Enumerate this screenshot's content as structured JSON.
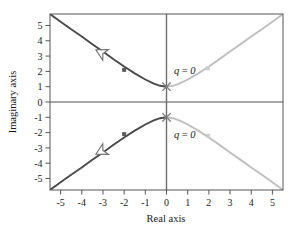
{
  "chart_data": {
    "type": "line",
    "title": "",
    "xlabel": "Real axis",
    "ylabel": "Imaginary axis",
    "xlim": [
      -5.5,
      5.5
    ],
    "ylim": [
      -5.75,
      5.75
    ],
    "xticks": [
      "-5",
      "-4",
      "-3",
      "-2",
      "-1",
      "0",
      "1",
      "2",
      "3",
      "4",
      "5"
    ],
    "xtick_values": [
      -5,
      -4,
      -3,
      -2,
      -1,
      0,
      1,
      2,
      3,
      4,
      5
    ],
    "yticks": [
      "5",
      "4",
      "3",
      "2",
      "1",
      "0",
      "-1",
      "-2",
      "-3",
      "-4",
      "-5"
    ],
    "ytick_values": [
      5,
      4,
      3,
      2,
      1,
      0,
      -1,
      -2,
      -3,
      -4,
      -5
    ],
    "grid": false,
    "legend": null,
    "colors": {
      "dark_branch": "#4a4a4a",
      "light_branch": "#bfbfbf",
      "frame": "#555555",
      "axis_line": "#8a8a8a",
      "vertical_axis": "#6e6e6e",
      "text": "#1a1a1a"
    },
    "annotations": [
      {
        "text": "q = 0",
        "x": 0.35,
        "y": 2.1
      },
      {
        "text": "q = 0",
        "x": 0.35,
        "y": -2.1
      }
    ],
    "markers": [
      {
        "type": "x",
        "label": "open-loop-pole",
        "x": 0,
        "y": 1
      },
      {
        "type": "x",
        "label": "open-loop-pole",
        "x": 0,
        "y": -1
      },
      {
        "type": "square",
        "label": "branch-point",
        "x": -2.0,
        "y": 2.1
      },
      {
        "type": "square",
        "label": "branch-point",
        "x": -2.0,
        "y": -2.1
      },
      {
        "type": "square",
        "label": "branch-point",
        "x": 1.95,
        "y": 2.2
      },
      {
        "type": "square",
        "label": "branch-point",
        "x": 1.95,
        "y": -2.2
      }
    ],
    "arrows": [
      {
        "label": "direction-arrow-upper",
        "x": -3.05,
        "y": 3.2,
        "angle": 208
      },
      {
        "label": "direction-arrow-lower",
        "x": -3.05,
        "y": -3.2,
        "angle": 152
      }
    ],
    "series": [
      {
        "name": "upper-branch-left",
        "color": "#4a4a4a",
        "points": [
          [
            -5.5,
            5.75
          ],
          [
            -5.0,
            5.25
          ],
          [
            -4.5,
            4.75
          ],
          [
            -4.0,
            4.28
          ],
          [
            -3.5,
            3.78
          ],
          [
            -3.0,
            3.3
          ],
          [
            -2.5,
            2.8
          ],
          [
            -2.0,
            2.32
          ],
          [
            -1.5,
            1.87
          ],
          [
            -1.0,
            1.47
          ],
          [
            -0.6,
            1.2
          ],
          [
            -0.3,
            1.06
          ],
          [
            0,
            1.0
          ]
        ]
      },
      {
        "name": "upper-branch-right",
        "color": "#bfbfbf",
        "points": [
          [
            0,
            1.0
          ],
          [
            0.3,
            1.06
          ],
          [
            0.6,
            1.2
          ],
          [
            1.0,
            1.47
          ],
          [
            1.5,
            1.87
          ],
          [
            2.0,
            2.32
          ],
          [
            2.5,
            2.8
          ],
          [
            3.0,
            3.3
          ],
          [
            3.5,
            3.78
          ],
          [
            4.0,
            4.28
          ],
          [
            4.5,
            4.75
          ],
          [
            5.0,
            5.25
          ],
          [
            5.45,
            5.7
          ]
        ]
      },
      {
        "name": "lower-branch-left",
        "color": "#4a4a4a",
        "points": [
          [
            -5.5,
            -5.75
          ],
          [
            -5.0,
            -5.25
          ],
          [
            -4.5,
            -4.75
          ],
          [
            -4.0,
            -4.28
          ],
          [
            -3.5,
            -3.78
          ],
          [
            -3.0,
            -3.3
          ],
          [
            -2.5,
            -2.8
          ],
          [
            -2.0,
            -2.32
          ],
          [
            -1.5,
            -1.87
          ],
          [
            -1.0,
            -1.47
          ],
          [
            -0.6,
            -1.2
          ],
          [
            -0.3,
            -1.06
          ],
          [
            0,
            -1.0
          ]
        ]
      },
      {
        "name": "lower-branch-right",
        "color": "#bfbfbf",
        "points": [
          [
            0,
            -1.0
          ],
          [
            0.3,
            -1.06
          ],
          [
            0.6,
            -1.2
          ],
          [
            1.0,
            -1.47
          ],
          [
            1.5,
            -1.87
          ],
          [
            2.0,
            -2.32
          ],
          [
            2.5,
            -2.8
          ],
          [
            3.0,
            -3.3
          ],
          [
            3.5,
            -3.78
          ],
          [
            4.0,
            -4.28
          ],
          [
            4.5,
            -4.75
          ],
          [
            5.0,
            -5.25
          ],
          [
            5.45,
            -5.7
          ]
        ]
      }
    ]
  },
  "labels": {
    "xlabel": "Real axis",
    "ylabel": "Imaginary axis",
    "annot_upper": "q = 0",
    "annot_lower": "q = 0"
  }
}
